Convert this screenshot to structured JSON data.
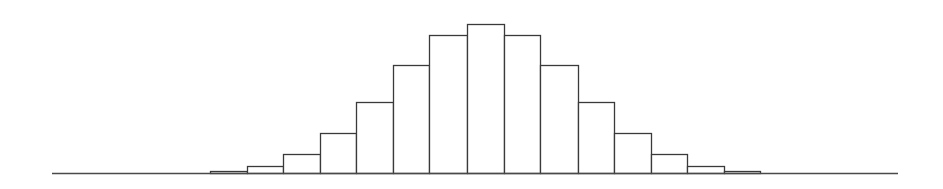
{
  "chart_data": {
    "type": "bar",
    "subtype": "histogram",
    "title": "",
    "xlabel": "",
    "ylabel": "",
    "categories": [
      "1",
      "2",
      "3",
      "4",
      "5",
      "6",
      "7",
      "8",
      "9",
      "10",
      "11",
      "12",
      "13",
      "14",
      "15"
    ],
    "values": [
      2,
      7,
      19,
      40,
      71,
      108,
      138,
      149,
      138,
      108,
      71,
      40,
      19,
      7,
      2
    ],
    "ylim": [
      0,
      149
    ],
    "grid": false,
    "legend": null,
    "tick_labels_visible": false
  },
  "style": {
    "bar_fill": "#ffffff",
    "bar_stroke": "#3a3a3a",
    "axis_color": "#4a4a4a",
    "background": "#ffffff"
  },
  "layout": {
    "axis_x_start": 52,
    "axis_x_end": 898,
    "baseline_y": 173,
    "bin_edges": [
      210,
      247,
      283,
      320,
      356,
      393,
      429,
      467,
      504,
      540,
      578,
      614,
      651,
      687,
      724,
      760
    ]
  }
}
